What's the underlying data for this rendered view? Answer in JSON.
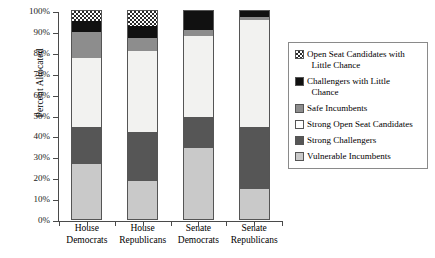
{
  "chart_data": {
    "type": "bar",
    "subtype": "stacked-bar-100-percent",
    "title": "",
    "xlabel": "",
    "ylabel": "Percent Allocated",
    "ylim": [
      0,
      100
    ],
    "yticks": [
      "0%",
      "10%",
      "20%",
      "30%",
      "40%",
      "50%",
      "60%",
      "70%",
      "80%",
      "90%",
      "100%"
    ],
    "ytick_values": [
      0,
      10,
      20,
      30,
      40,
      50,
      60,
      70,
      80,
      90,
      100
    ],
    "grid": false,
    "legend_position": "right",
    "categories": [
      "House Democrats",
      "House Republicans",
      "Senate Democrats",
      "Senate Republicans"
    ],
    "category_lines": [
      [
        "House",
        "Democrats"
      ],
      [
        "House",
        "Republicans"
      ],
      [
        "Senate",
        "Democrats"
      ],
      [
        "Senate",
        "Republicans"
      ]
    ],
    "series": [
      {
        "name": "Vulnerable Incumbents",
        "values": [
          27.0,
          18.5,
          34.5,
          15.0
        ]
      },
      {
        "name": "Strong Challengers",
        "values": [
          17.5,
          23.5,
          15.0,
          29.5
        ]
      },
      {
        "name": "Strong Open Seat Candidates",
        "values": [
          33.0,
          39.0,
          38.5,
          51.0
        ]
      },
      {
        "name": "Safe Incumbents",
        "values": [
          12.5,
          6.0,
          3.0,
          1.5
        ]
      },
      {
        "name": "Challengers with Little Chance",
        "values": [
          5.0,
          6.0,
          9.0,
          3.0
        ]
      },
      {
        "name": "Open Seat Candidates with Little Chance",
        "values": [
          5.0,
          7.0,
          0.0,
          0.0
        ]
      }
    ],
    "legend_entries": [
      {
        "label_line1": "Open Seat Candidates with",
        "label_line2": "Little Chance",
        "swatch": "checkerboard"
      },
      {
        "label_line1": "Challengers with Little",
        "label_line2": "Chance",
        "swatch": "black"
      },
      {
        "label_line1": "Safe Incumbents",
        "label_line2": "",
        "swatch": "mid-gray"
      },
      {
        "label_line1": "Strong Open Seat Candidates",
        "label_line2": "",
        "swatch": "white"
      },
      {
        "label_line1": "Strong Challengers",
        "label_line2": "",
        "swatch": "dark-gray"
      },
      {
        "label_line1": "Vulnerable Incumbents",
        "label_line2": "",
        "swatch": "light-gray"
      }
    ],
    "colors": {
      "vulnerable_incumbents": "#c9c9c9",
      "strong_challengers": "#565656",
      "strong_open_seat_candidates": "#f2f2f0",
      "safe_incumbents": "#8d8d8d",
      "challengers_little_chance": "#111111",
      "open_seat_little_chance": "#2a2a2a",
      "axis": "#4a4a4a"
    }
  }
}
